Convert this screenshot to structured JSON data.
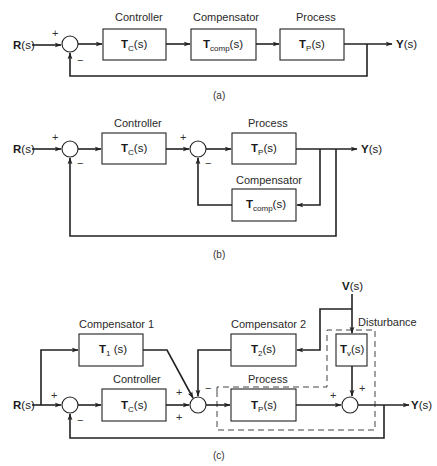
{
  "diagram_a": {
    "caption": "(a)",
    "input": {
      "letter": "R",
      "arg": "(s)"
    },
    "output": {
      "letter": "Y",
      "arg": "(s)"
    },
    "blocks": [
      {
        "title": "Controller",
        "T": "T",
        "sub": "C",
        "arg": "(s)"
      },
      {
        "title": "Compensator",
        "T": "T",
        "sub": "comp",
        "arg": "(s)"
      },
      {
        "title": "Process",
        "T": "T",
        "sub": "P",
        "arg": "(s)"
      }
    ],
    "signs": {
      "plus": "+",
      "minus": "−"
    }
  },
  "diagram_b": {
    "caption": "(b)",
    "input": {
      "letter": "R",
      "arg": "(s)"
    },
    "output": {
      "letter": "Y",
      "arg": "(s)"
    },
    "blocks": [
      {
        "title": "Controller",
        "T": "T",
        "sub": "C",
        "arg": "(s)"
      },
      {
        "title": "Process",
        "T": "T",
        "sub": "P",
        "arg": "(s)"
      },
      {
        "title": "Compensator",
        "T": "T",
        "sub": "comp",
        "arg": "(s)"
      }
    ],
    "signs": {
      "plus": "+",
      "minus": "−"
    }
  },
  "diagram_c": {
    "caption": "(c)",
    "input": {
      "letter": "R",
      "arg": "(s)"
    },
    "output": {
      "letter": "Y",
      "arg": "(s)"
    },
    "disturbance_input": {
      "letter": "V",
      "arg": "(s)"
    },
    "blocks": [
      {
        "title": "Compensator 1",
        "T": "T",
        "sub": "1",
        "arg": " (s)"
      },
      {
        "title": "Controller",
        "T": "T",
        "sub": "C",
        "arg": "(s)"
      },
      {
        "title": "Compensator 2",
        "T": "T",
        "sub": "2",
        "arg": "(s)"
      },
      {
        "title": "Process",
        "T": "T",
        "sub": "P",
        "arg": "(s)"
      },
      {
        "title": "Disturbance",
        "T": "T",
        "sub": "v",
        "arg": "(s)"
      }
    ],
    "signs": {
      "plus": "+",
      "minus": "−"
    }
  }
}
